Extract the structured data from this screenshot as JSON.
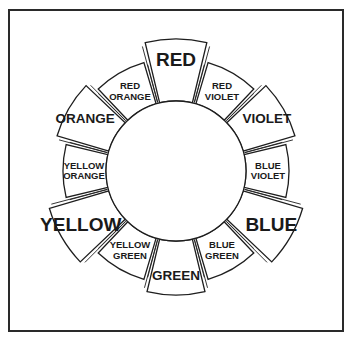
{
  "diagram": {
    "type": "color-wheel",
    "frame": {
      "border_color": "#2a2a2a",
      "background": "#ffffff"
    },
    "center": {
      "x": 176,
      "y": 171
    },
    "inner_radius": 70,
    "segment_span_deg": 27,
    "segments": [
      {
        "id": "red",
        "lines": [
          "RED"
        ],
        "tier": "primary",
        "angle": 0
      },
      {
        "id": "red-violet",
        "lines": [
          "RED",
          "VIOLET"
        ],
        "tier": "tertiary",
        "angle": 30
      },
      {
        "id": "violet",
        "lines": [
          "VIOLET"
        ],
        "tier": "secondary",
        "angle": 60
      },
      {
        "id": "blue-violet",
        "lines": [
          "BLUE",
          "VIOLET"
        ],
        "tier": "tertiary",
        "angle": 90
      },
      {
        "id": "blue",
        "lines": [
          "BLUE"
        ],
        "tier": "primary",
        "angle": 120
      },
      {
        "id": "blue-green",
        "lines": [
          "BLUE",
          "GREEN"
        ],
        "tier": "tertiary",
        "angle": 150
      },
      {
        "id": "green",
        "lines": [
          "GREEN"
        ],
        "tier": "secondary",
        "angle": 180
      },
      {
        "id": "yellow-green",
        "lines": [
          "YELLOW",
          "GREEN"
        ],
        "tier": "tertiary",
        "angle": 210
      },
      {
        "id": "yellow",
        "lines": [
          "YELLOW"
        ],
        "tier": "primary",
        "angle": 240
      },
      {
        "id": "yellow-orange",
        "lines": [
          "YELLOW",
          "ORANGE"
        ],
        "tier": "tertiary",
        "angle": 270
      },
      {
        "id": "orange",
        "lines": [
          "ORANGE"
        ],
        "tier": "secondary",
        "angle": 300
      },
      {
        "id": "red-orange",
        "lines": [
          "RED",
          "ORANGE"
        ],
        "tier": "tertiary",
        "angle": 330
      }
    ],
    "tiers": {
      "primary": {
        "outer_radius": 132,
        "font_size": 19,
        "label_radius": 110
      },
      "secondary": {
        "outer_radius": 124,
        "font_size": 13.5,
        "label_radius": 105
      },
      "tertiary": {
        "outer_radius": 113,
        "font_size": 9.5,
        "label_radius": 92
      }
    }
  }
}
